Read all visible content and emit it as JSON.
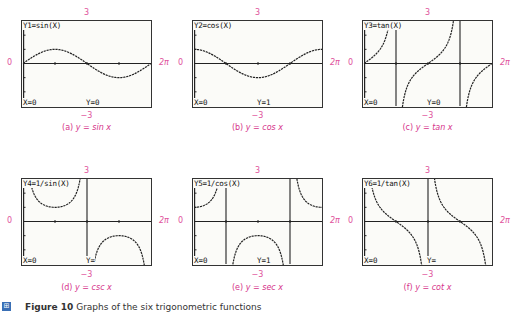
{
  "figure": {
    "number_label": "Figure 10",
    "caption_text": "Graphs of the six trigonometric functions",
    "icon": "figure-icon"
  },
  "window": {
    "xmin_label": "0",
    "xmax_label": "2π",
    "ymax_label": "3",
    "ymin_label": "−3"
  },
  "panels": [
    {
      "id": "a",
      "screen_label": "Y1=sin(X)",
      "x_status": "X=0",
      "y_status": "Y=0",
      "caption_prefix": "(a)",
      "caption_eq": "y = sin x"
    },
    {
      "id": "b",
      "screen_label": "Y2=cos(X)",
      "x_status": "X=0",
      "y_status": "Y=1",
      "caption_prefix": "(b)",
      "caption_eq": "y = cos x"
    },
    {
      "id": "c",
      "screen_label": "Y3=tan(X)",
      "x_status": "X=0",
      "y_status": "Y=0",
      "caption_prefix": "(c)",
      "caption_eq": "y = tan x"
    },
    {
      "id": "d",
      "screen_label": "Y4=1/sin(X)",
      "x_status": "X=0",
      "y_status": "Y=",
      "caption_prefix": "(d)",
      "caption_eq": "y = csc x"
    },
    {
      "id": "e",
      "screen_label": "Y5=1/cos(X)",
      "x_status": "X=0",
      "y_status": "Y=1",
      "caption_prefix": "(e)",
      "caption_eq": "y = sec x"
    },
    {
      "id": "f",
      "screen_label": "Y6=1/tan(X)",
      "x_status": "X=0",
      "y_status": "Y=",
      "caption_prefix": "(f)",
      "caption_eq": "y = cot x"
    }
  ],
  "chart_data": [
    {
      "type": "line",
      "title": "(a) y = sin x",
      "function": "sin(x)",
      "xlim": [
        0,
        6.2832
      ],
      "ylim": [
        -3,
        3
      ],
      "xlabel": "",
      "ylabel": "",
      "tick_labels": {
        "x": [
          "0",
          "2π"
        ],
        "y": [
          "−3",
          "3"
        ]
      },
      "grid": false
    },
    {
      "type": "line",
      "title": "(b) y = cos x",
      "function": "cos(x)",
      "xlim": [
        0,
        6.2832
      ],
      "ylim": [
        -3,
        3
      ],
      "tick_labels": {
        "x": [
          "0",
          "2π"
        ],
        "y": [
          "−3",
          "3"
        ]
      },
      "grid": false
    },
    {
      "type": "line",
      "title": "(c) y = tan x",
      "function": "tan(x)",
      "xlim": [
        0,
        6.2832
      ],
      "ylim": [
        -3,
        3
      ],
      "asymptotes": [
        1.5708,
        4.7124
      ],
      "tick_labels": {
        "x": [
          "0",
          "2π"
        ],
        "y": [
          "−3",
          "3"
        ]
      },
      "grid": false
    },
    {
      "type": "line",
      "title": "(d) y = csc x",
      "function": "1/sin(x)",
      "xlim": [
        0,
        6.2832
      ],
      "ylim": [
        -3,
        3
      ],
      "asymptotes": [
        3.1416
      ],
      "tick_labels": {
        "x": [
          "0",
          "2π"
        ],
        "y": [
          "−3",
          "3"
        ]
      },
      "grid": false
    },
    {
      "type": "line",
      "title": "(e) y = sec x",
      "function": "1/cos(x)",
      "xlim": [
        0,
        6.2832
      ],
      "ylim": [
        -3,
        3
      ],
      "asymptotes": [
        1.5708,
        4.7124
      ],
      "tick_labels": {
        "x": [
          "0",
          "2π"
        ],
        "y": [
          "−3",
          "3"
        ]
      },
      "grid": false
    },
    {
      "type": "line",
      "title": "(f) y = cot x",
      "function": "1/tan(x)",
      "xlim": [
        0,
        6.2832
      ],
      "ylim": [
        -3,
        3
      ],
      "asymptotes": [
        3.1416
      ],
      "tick_labels": {
        "x": [
          "0",
          "2π"
        ],
        "y": [
          "−3",
          "3"
        ]
      },
      "grid": false
    }
  ]
}
